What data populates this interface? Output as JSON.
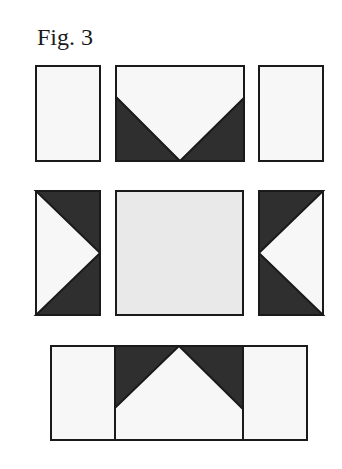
{
  "figure": {
    "title": "Fig. 3",
    "colors": {
      "dark": "#2f2f2f",
      "light": "#f7f7f7",
      "center": "#e9e9e9",
      "stroke": "#1a1a1a"
    },
    "rows": [
      {
        "name": "top-row",
        "pieces": [
          "plain-rectangle",
          "flying-geese-down",
          "plain-rectangle"
        ]
      },
      {
        "name": "middle-row",
        "pieces": [
          "flying-geese-right",
          "center-square",
          "flying-geese-left"
        ]
      },
      {
        "name": "bottom-row",
        "pieces": [
          "plain-rectangle",
          "flying-geese-up",
          "plain-rectangle"
        ]
      }
    ]
  }
}
